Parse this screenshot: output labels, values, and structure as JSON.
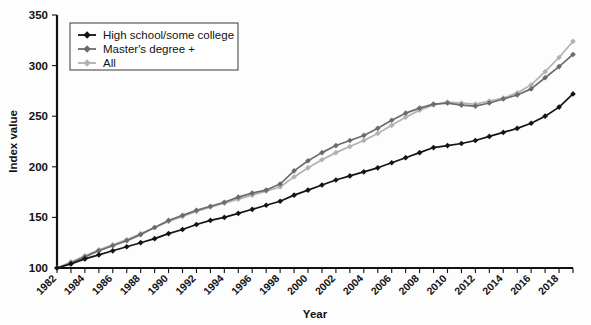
{
  "chart_data": {
    "type": "line",
    "title": "",
    "xlabel": "Year",
    "ylabel": "Index value",
    "xlim": [
      1982,
      2019
    ],
    "ylim": [
      100,
      350
    ],
    "yticks": [
      100,
      150,
      200,
      250,
      300,
      350
    ],
    "xticks": [
      1982,
      1984,
      1986,
      1988,
      1990,
      1992,
      1994,
      1996,
      1998,
      2000,
      2002,
      2004,
      2006,
      2008,
      2010,
      2012,
      2014,
      2016,
      2018
    ],
    "x": [
      1982,
      1983,
      1984,
      1985,
      1986,
      1987,
      1988,
      1989,
      1990,
      1991,
      1992,
      1993,
      1994,
      1995,
      1996,
      1997,
      1998,
      1999,
      2000,
      2001,
      2002,
      2003,
      2004,
      2005,
      2006,
      2007,
      2008,
      2009,
      2010,
      2011,
      2012,
      2013,
      2014,
      2015,
      2016,
      2017,
      2018,
      2019
    ],
    "grid": false,
    "legend_position": "top-left",
    "series": [
      {
        "name": "High school/some college",
        "color": "#141414",
        "marker": "diamond",
        "values": [
          100,
          104,
          109,
          113,
          117,
          121,
          125,
          129,
          134,
          138,
          143,
          147,
          150,
          154,
          158,
          162,
          166,
          172,
          177,
          182,
          187,
          191,
          195,
          199,
          204,
          209,
          214,
          219,
          221,
          223,
          226,
          230,
          234,
          238,
          243,
          250,
          259,
          272
        ]
      },
      {
        "name": "Master's degree +",
        "color": "#6b6b6b",
        "marker": "diamond",
        "values": [
          100,
          105,
          111,
          117,
          122,
          127,
          133,
          140,
          147,
          152,
          157,
          161,
          165,
          170,
          174,
          177,
          183,
          196,
          206,
          214,
          221,
          226,
          231,
          238,
          246,
          253,
          258,
          262,
          263,
          261,
          260,
          263,
          267,
          271,
          277,
          288,
          299,
          311
        ]
      },
      {
        "name": "All",
        "color": "#b2b2b2",
        "marker": "diamond",
        "values": [
          100,
          106,
          112,
          118,
          123,
          128,
          134,
          140,
          146,
          151,
          156,
          160,
          164,
          168,
          172,
          176,
          180,
          190,
          199,
          207,
          214,
          220,
          226,
          233,
          241,
          249,
          256,
          261,
          264,
          263,
          262,
          265,
          268,
          273,
          281,
          294,
          308,
          324
        ]
      }
    ]
  },
  "legend": {
    "entries": [
      {
        "label": "High school/some college"
      },
      {
        "label": "Master's degree +"
      },
      {
        "label": "All"
      }
    ]
  },
  "axes": {
    "y_title": "Index value",
    "x_title": "Year"
  }
}
